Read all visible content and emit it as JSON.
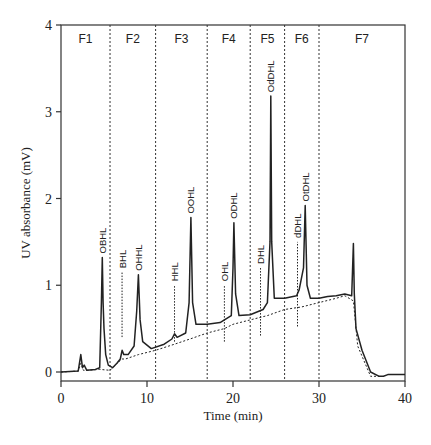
{
  "chart_data": {
    "type": "line",
    "title": "",
    "xlabel": "Time (min)",
    "ylabel": "UV absorbance (mV)",
    "xlim": [
      0,
      40
    ],
    "ylim": [
      -0.1,
      4
    ],
    "x_ticks": [
      0,
      10,
      20,
      30,
      40
    ],
    "y_ticks": [
      0,
      1,
      2,
      3,
      4
    ],
    "grid": false,
    "legend": null,
    "fractions": [
      {
        "label": "F1",
        "start": 0,
        "end": 5.7
      },
      {
        "label": "F2",
        "start": 5.7,
        "end": 11
      },
      {
        "label": "F3",
        "start": 11,
        "end": 17
      },
      {
        "label": "F4",
        "start": 17,
        "end": 22
      },
      {
        "label": "F5",
        "start": 22,
        "end": 26
      },
      {
        "label": "F6",
        "start": 26,
        "end": 30
      },
      {
        "label": "F7",
        "start": 30,
        "end": 40
      }
    ],
    "fraction_boundaries": [
      5.7,
      11,
      17,
      22,
      26,
      30
    ],
    "peaks": [
      {
        "label": "OBHL",
        "time": 4.8,
        "height": 1.32,
        "series": "solid"
      },
      {
        "label": "BHL",
        "time": 7.1,
        "height": 1.15,
        "series": "dotted"
      },
      {
        "label": "OHHL",
        "time": 9.0,
        "height": 1.12,
        "series": "solid"
      },
      {
        "label": "HHL",
        "time": 13.2,
        "height": 1.0,
        "series": "dotted"
      },
      {
        "label": "OOHL",
        "time": 15.1,
        "height": 1.78,
        "series": "solid"
      },
      {
        "label": "OHL",
        "time": 19.0,
        "height": 1.0,
        "series": "dotted"
      },
      {
        "label": "ODHL",
        "time": 20.1,
        "height": 1.72,
        "series": "solid"
      },
      {
        "label": "DHL",
        "time": 23.2,
        "height": 1.2,
        "series": "dotted"
      },
      {
        "label": "OdDHL",
        "time": 24.4,
        "height": 3.18,
        "series": "solid"
      },
      {
        "label": "dDHL",
        "time": 27.5,
        "height": 1.5,
        "series": "dotted"
      },
      {
        "label": "OtDHL",
        "time": 28.4,
        "height": 1.92,
        "series": "solid"
      }
    ],
    "series": [
      {
        "name": "solid trace",
        "style": "solid",
        "x": [
          0,
          2.0,
          2.3,
          2.5,
          2.7,
          3.0,
          4.0,
          4.5,
          4.7,
          4.8,
          4.9,
          5.0,
          5.2,
          5.5,
          6.0,
          6.5,
          6.9,
          7.1,
          7.3,
          7.8,
          8.5,
          8.8,
          9.0,
          9.2,
          9.5,
          10.5,
          12.0,
          12.9,
          13.2,
          13.5,
          14.5,
          14.9,
          15.1,
          15.3,
          15.7,
          17.0,
          18.5,
          19.0,
          19.8,
          20.0,
          20.1,
          20.3,
          20.7,
          22.0,
          23.0,
          23.5,
          24.0,
          24.3,
          24.4,
          24.5,
          24.8,
          26.0,
          27.4,
          27.7,
          28.2,
          28.4,
          28.6,
          29.0,
          30.0,
          31.0,
          32.0,
          33.0,
          33.8,
          34.0,
          34.1,
          34.3,
          35.0,
          36.0,
          37.0,
          37.5,
          38.0,
          40.0
        ],
        "y": [
          0.0,
          0.01,
          0.2,
          0.05,
          0.08,
          0.02,
          0.03,
          0.05,
          0.8,
          1.32,
          0.8,
          0.5,
          0.2,
          0.08,
          0.05,
          0.1,
          0.15,
          0.25,
          0.2,
          0.2,
          0.3,
          0.7,
          1.12,
          0.6,
          0.35,
          0.27,
          0.32,
          0.38,
          0.44,
          0.4,
          0.45,
          0.8,
          1.78,
          0.8,
          0.55,
          0.55,
          0.57,
          0.6,
          0.65,
          1.2,
          1.72,
          0.9,
          0.65,
          0.66,
          0.7,
          0.72,
          0.8,
          1.5,
          3.18,
          1.5,
          0.85,
          0.85,
          0.88,
          0.95,
          1.2,
          1.92,
          1.0,
          0.85,
          0.85,
          0.87,
          0.88,
          0.9,
          0.88,
          1.48,
          0.9,
          0.5,
          0.25,
          0.0,
          -0.05,
          -0.05,
          -0.03,
          -0.03
        ]
      },
      {
        "name": "dotted trace",
        "style": "dotted",
        "x": [
          0,
          2.0,
          2.3,
          2.6,
          3.0,
          4.5,
          5.7,
          6.5,
          7.1,
          7.5,
          9.0,
          11.0,
          13.2,
          15.0,
          17.0,
          19.0,
          20.0,
          22.0,
          24.0,
          26.0,
          28.0,
          30.0,
          32.0,
          33.0,
          34.0,
          34.5,
          36.0,
          37.0
        ],
        "y": [
          0.0,
          0.01,
          0.1,
          0.02,
          0.02,
          0.03,
          0.02,
          0.1,
          0.15,
          0.15,
          0.2,
          0.25,
          0.32,
          0.38,
          0.45,
          0.5,
          0.55,
          0.6,
          0.65,
          0.72,
          0.75,
          0.8,
          0.85,
          0.88,
          0.82,
          0.3,
          -0.05,
          -0.05
        ]
      }
    ]
  }
}
